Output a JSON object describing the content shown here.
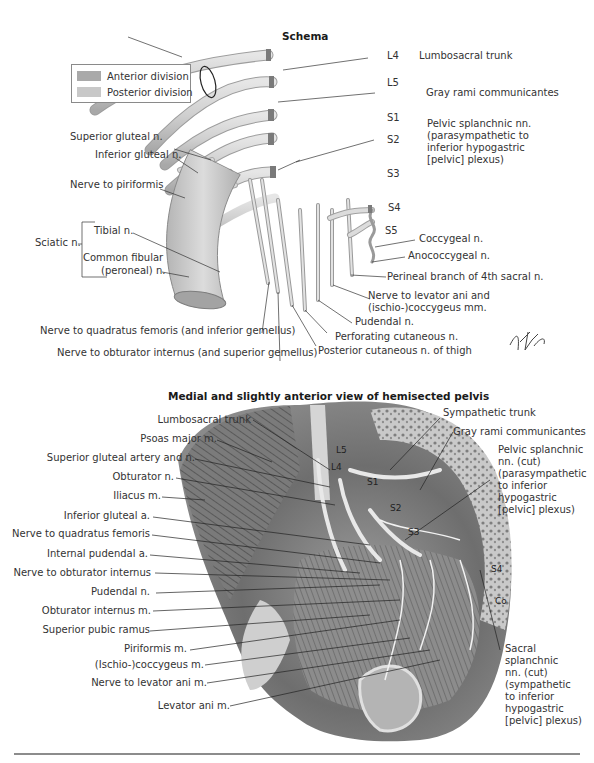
{
  "figure": {
    "schema": {
      "title": "Schema",
      "legend": [
        {
          "label": "Anterior division",
          "color": "#a9a9a9"
        },
        {
          "label": "Posterior division",
          "color": "#c8c8c8"
        }
      ],
      "segments": [
        "L4",
        "L5",
        "S1",
        "S2",
        "S3",
        "S4",
        "S5"
      ],
      "labels_right": {
        "lumbosacral_trunk": "Lumbosacral trunk",
        "gray_rami": "Gray rami communicantes",
        "pelvic_splanchnic": [
          "Pelvic splanchnic nn.",
          "(parasympathetic to",
          "inferior hypogastric",
          "[pelvic] plexus)"
        ],
        "coccygeal": "Coccygeal n.",
        "anococcygeal": "Anococcygeal n.",
        "perineal_branch": "Perineal branch of 4th sacral n.",
        "levator_ani": [
          "Nerve to levator ani and",
          "(ischio-)coccygeus mm."
        ],
        "pudendal": "Pudendal n.",
        "perforating_cutaneous": "Perforating cutaneous n.",
        "posterior_cutaneous": "Posterior cutaneous n. of thigh"
      },
      "labels_left": {
        "superior_gluteal": "Superior gluteal n.",
        "inferior_gluteal": "Inferior gluteal n.",
        "nerve_piriformis": "Nerve to piriformis",
        "sciatic": "Sciatic n.",
        "tibial": "Tibial n.",
        "common_fibular": [
          "Common fibular",
          "(peroneal) n."
        ]
      },
      "labels_bottom": {
        "quadratus_femoris": "Nerve to quadratus femoris (and inferior gemellus)",
        "obturator_internus": "Nerve to obturator internus (and superior gemellus)"
      },
      "signature": "F. Netter M.D."
    },
    "pelvis": {
      "title": "Medial and slightly anterior view of hemisected pelvis",
      "labels_left": [
        "Lumbosacral trunk",
        "Psoas major m.",
        "Superior gluteal artery and n.",
        "Obturator n.",
        "Iliacus m.",
        "Inferior gluteal a.",
        "Nerve to quadratus femoris",
        "Internal pudendal a.",
        "Nerve to obturator internus",
        "Pudendal n.",
        "Obturator internus m.",
        "Superior pubic ramus",
        "Piriformis m.",
        "(Ischio-)coccygeus m.",
        "Nerve to levator ani m.",
        "Levator ani m."
      ],
      "labels_right": {
        "sympathetic_trunk": "Sympathetic trunk",
        "gray_rami": "Gray rami communicantes",
        "pelvic_splanchnic": [
          "Pelvic splanchnic",
          "nn. (cut)",
          "(parasympathetic",
          "to inferior",
          "hypogastric",
          "[pelvic] plexus)"
        ],
        "sacral_splanchnic": [
          "Sacral",
          "splanchnic",
          "nn. (cut)",
          "(sympathetic",
          "to inferior",
          "hypogastric",
          "[pelvic] plexus)"
        ]
      },
      "segments": [
        "L4",
        "L5",
        "S1",
        "S2",
        "S3",
        "S4",
        "Co"
      ]
    }
  }
}
